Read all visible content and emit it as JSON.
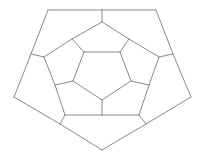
{
  "diagram": {
    "title": "",
    "type": "schlegel-diagram-dodecahedron",
    "stroke_color": "#8a8a8a",
    "background": "#ffffff",
    "vertices": {
      "O0": [
        48,
        10
      ],
      "O1": [
        156,
        10
      ],
      "O2": [
        191,
        97
      ],
      "O3": [
        102,
        150
      ],
      "O4": [
        14,
        97
      ],
      "J0": [
        102,
        10
      ],
      "J1": [
        173,
        54
      ],
      "J2": [
        146,
        124
      ],
      "J3": [
        60,
        124
      ],
      "J4": [
        31,
        54
      ],
      "A0": [
        102,
        22
      ],
      "A1": [
        159,
        57
      ],
      "A2": [
        139,
        115
      ],
      "A3": [
        65,
        115
      ],
      "A4": [
        44,
        57
      ],
      "B0": [
        72,
        39
      ],
      "B1": [
        129,
        39
      ],
      "B2": [
        149,
        85
      ],
      "B3": [
        102,
        115
      ],
      "B4": [
        55,
        85
      ],
      "I0": [
        84,
        52
      ],
      "I1": [
        120,
        52
      ],
      "I2": [
        131,
        81
      ],
      "I3": [
        102,
        100
      ],
      "I4": [
        73,
        81
      ]
    },
    "edges": [
      [
        "O0",
        "J0"
      ],
      [
        "J0",
        "O1"
      ],
      [
        "O1",
        "J1"
      ],
      [
        "J1",
        "O2"
      ],
      [
        "O2",
        "J2"
      ],
      [
        "J2",
        "O3"
      ],
      [
        "O3",
        "J3"
      ],
      [
        "J3",
        "O4"
      ],
      [
        "O4",
        "J4"
      ],
      [
        "J4",
        "O0"
      ],
      [
        "J0",
        "A0"
      ],
      [
        "J1",
        "A1"
      ],
      [
        "J2",
        "A2"
      ],
      [
        "J3",
        "A3"
      ],
      [
        "J4",
        "A4"
      ],
      [
        "A0",
        "B0"
      ],
      [
        "A0",
        "B1"
      ],
      [
        "B1",
        "A1"
      ],
      [
        "A1",
        "B2"
      ],
      [
        "B2",
        "A2"
      ],
      [
        "A2",
        "B3"
      ],
      [
        "B3",
        "A3"
      ],
      [
        "A3",
        "B4"
      ],
      [
        "B4",
        "A4"
      ],
      [
        "A4",
        "B0"
      ],
      [
        "B0",
        "I0"
      ],
      [
        "B1",
        "I1"
      ],
      [
        "B2",
        "I2"
      ],
      [
        "B3",
        "I3"
      ],
      [
        "B4",
        "I4"
      ],
      [
        "I0",
        "I1"
      ],
      [
        "I1",
        "I2"
      ],
      [
        "I2",
        "I3"
      ],
      [
        "I3",
        "I4"
      ],
      [
        "I4",
        "I0"
      ]
    ]
  }
}
